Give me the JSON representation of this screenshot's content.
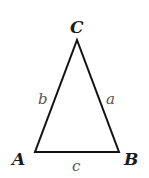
{
  "diagram": {
    "type": "triangle",
    "vertices": [
      {
        "label": "A",
        "x": 35,
        "y": 152
      },
      {
        "label": "B",
        "x": 119,
        "y": 152
      },
      {
        "label": "C",
        "x": 77,
        "y": 40
      }
    ],
    "sides": [
      {
        "label": "a",
        "between": [
          "B",
          "C"
        ]
      },
      {
        "label": "b",
        "between": [
          "A",
          "C"
        ]
      },
      {
        "label": "c",
        "between": [
          "A",
          "B"
        ]
      }
    ],
    "colors": {
      "stroke": "#111111",
      "vertex_label": "#1a1a1a",
      "side_label": "#555555",
      "background": "#ffffff"
    }
  },
  "labels": {
    "vertex_a": "A",
    "vertex_b": "B",
    "vertex_c": "C",
    "side_a": "a",
    "side_b": "b",
    "side_c": "c"
  }
}
